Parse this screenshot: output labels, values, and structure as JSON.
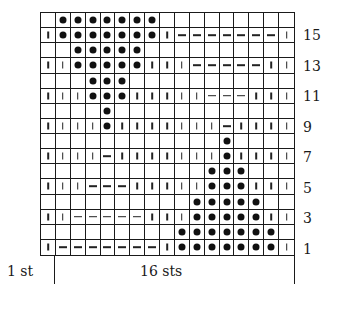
{
  "chart": {
    "columns": 17,
    "rows": 16,
    "legend_codes": {
      "B": "blank-square",
      "I": "knit-bar",
      "D": "purl-dash",
      "O": "bobble-dot"
    },
    "grid_top_to_bottom": [
      {
        "row": 16,
        "cells": "BOOOOOOOBBBBBBBBB"
      },
      {
        "row": 15,
        "cells": "IOOOOOOOIDDDDDDDI"
      },
      {
        "row": 14,
        "cells": "BBOOOOOBBBBBBBBBB"
      },
      {
        "row": 13,
        "cells": "IIOOOOOIIIDDDDDII"
      },
      {
        "row": 12,
        "cells": "BBBOOOBBBBBBBBBBB"
      },
      {
        "row": 11,
        "cells": "IIIOOOIIIIIDDDIII"
      },
      {
        "row": 10,
        "cells": "BBBBOBBBBBBBBBBBB"
      },
      {
        "row": 9,
        "cells": "IIIIOIIIIIIIDIIII"
      },
      {
        "row": 8,
        "cells": "BBBBBBBBBBBBOBBBB"
      },
      {
        "row": 7,
        "cells": "IIIIDIIIIIIIOIIII"
      },
      {
        "row": 6,
        "cells": "BBBBBBBBBBBOOOBBB"
      },
      {
        "row": 5,
        "cells": "IIIDDDIIIIIOOOIII"
      },
      {
        "row": 4,
        "cells": "BBBBBBBBBBOOOOOBB"
      },
      {
        "row": 3,
        "cells": "IIDDDDDIIIOOOOOII"
      },
      {
        "row": 2,
        "cells": "BBBBBBBBBOOOOOOOB"
      },
      {
        "row": 1,
        "cells": "IDDDDDDDIOOOOOOOI"
      }
    ],
    "row_labels": [
      "15",
      "13",
      "11",
      "9",
      "7",
      "5",
      "3",
      "1"
    ]
  },
  "footer": {
    "edge_label": "1 st",
    "repeat_label": "16 sts"
  }
}
